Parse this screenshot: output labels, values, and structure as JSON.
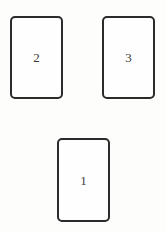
{
  "scene": {
    "background_color": "#fdfdfc",
    "card_border_color": "#2b2b2b",
    "card_fill_color": "#fefefe",
    "label_color": "#3a3a3a"
  },
  "cards": [
    {
      "name": "card-top-left",
      "label": "2",
      "position": "top-left",
      "x": 10,
      "y": 16,
      "width": 53,
      "height": 83
    },
    {
      "name": "card-top-right",
      "label": "3",
      "position": "top-right",
      "x": 102,
      "y": 16,
      "width": 53,
      "height": 83
    },
    {
      "name": "card-bottom",
      "label": "1",
      "position": "bottom-center",
      "x": 57,
      "y": 138,
      "width": 53,
      "height": 84
    }
  ]
}
